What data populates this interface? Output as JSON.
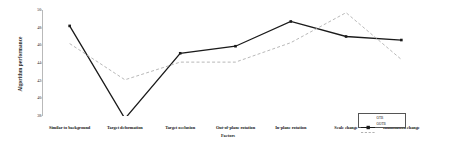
{
  "chart_data": {
    "type": "line",
    "title": "",
    "xlabel": "Factors",
    "ylabel": "Algorithm performance",
    "categories": [
      "Similar to background",
      "Target deformation",
      "Target occlusion",
      "Out-of-plane rotation",
      "In-plane rotation",
      "Scale change",
      "Illumination change"
    ],
    "yticks": [
      50,
      48,
      46,
      44,
      42,
      40,
      38
    ],
    "ylim": [
      38,
      50
    ],
    "grid": false,
    "legend_position": "bottom-right",
    "series": [
      {
        "name": "OTB",
        "style": "solid",
        "color": "#1a1a1a",
        "marker": "square",
        "values": [
          48.2,
          37.7,
          45.1,
          45.9,
          48.7,
          47.0,
          46.6
        ]
      },
      {
        "name": "OOTB",
        "style": "dashed",
        "color": "#b0b0b0",
        "marker": "none",
        "values": [
          46.2,
          42.1,
          44.1,
          44.1,
          46.3,
          49.7,
          44.4
        ]
      }
    ]
  }
}
